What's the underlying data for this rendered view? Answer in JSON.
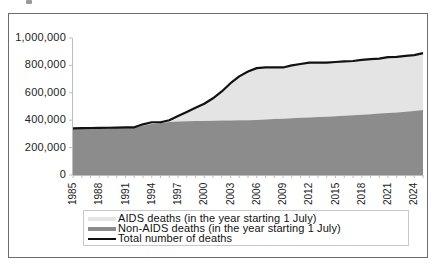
{
  "chart_data": {
    "type": "area",
    "title": "",
    "xlabel": "",
    "ylabel": "",
    "ylim": [
      0,
      1000000
    ],
    "xlim": [
      1985,
      2025
    ],
    "grid": false,
    "legend_position": "bottom",
    "y_ticks": [
      "0",
      "200,000",
      "400,000",
      "600,000",
      "800,000",
      "1,000,000"
    ],
    "y_tick_values": [
      0,
      200000,
      400000,
      600000,
      800000,
      1000000
    ],
    "x_ticks": [
      "1985",
      "1988",
      "1991",
      "1994",
      "1997",
      "2000",
      "2003",
      "2006",
      "2009",
      "2012",
      "2015",
      "2018",
      "2021",
      "2024"
    ],
    "x": [
      1985,
      1986,
      1987,
      1988,
      1989,
      1990,
      1991,
      1992,
      1993,
      1994,
      1995,
      1996,
      1997,
      1998,
      1999,
      2000,
      2001,
      2002,
      2003,
      2004,
      2005,
      2006,
      2007,
      2008,
      2009,
      2010,
      2011,
      2012,
      2013,
      2014,
      2015,
      2016,
      2017,
      2018,
      2019,
      2020,
      2021,
      2022,
      2023,
      2024,
      2025
    ],
    "series": [
      {
        "name": "Non-AIDS deaths (in the year starting 1 July)",
        "kind": "stacked-area",
        "color": "#8c8c8c",
        "values": [
          340000,
          342000,
          343000,
          344000,
          345000,
          346000,
          347000,
          348000,
          360000,
          372000,
          380000,
          386000,
          390000,
          392000,
          394000,
          395000,
          396000,
          397000,
          398000,
          399000,
          400000,
          402000,
          405000,
          408000,
          411000,
          414000,
          417000,
          420000,
          423000,
          426000,
          429000,
          432000,
          436000,
          440000,
          444000,
          448000,
          452000,
          457000,
          462000,
          468000,
          475000
        ]
      },
      {
        "name": "AIDS deaths (in the year starting 1 July)",
        "kind": "stacked-area",
        "color": "#e4e4e4",
        "values": [
          0,
          0,
          0,
          0,
          0,
          0,
          0,
          0,
          10000,
          13000,
          5000,
          14000,
          40000,
          68000,
          96000,
          125000,
          164000,
          213000,
          272000,
          321000,
          355000,
          378000,
          380000,
          377000,
          374000,
          386000,
          393000,
          400000,
          397000,
          394000,
          396000,
          398000,
          396000,
          400000,
          402000,
          402000,
          408000,
          405000,
          408000,
          407000,
          415000
        ]
      },
      {
        "name": "Total number of deaths",
        "kind": "line",
        "color": "#111111",
        "values": [
          340000,
          342000,
          343000,
          344000,
          345000,
          346000,
          347000,
          348000,
          370000,
          385000,
          385000,
          400000,
          430000,
          460000,
          490000,
          520000,
          560000,
          610000,
          670000,
          720000,
          755000,
          780000,
          785000,
          785000,
          785000,
          800000,
          810000,
          820000,
          820000,
          820000,
          825000,
          830000,
          832000,
          840000,
          846000,
          850000,
          860000,
          862000,
          870000,
          875000,
          890000
        ]
      }
    ]
  },
  "legend": {
    "items": [
      {
        "label": "AIDS deaths (in the year starting 1 July)",
        "swatch": "light-gray-band"
      },
      {
        "label": "Non-AIDS deaths (in the year starting 1 July)",
        "swatch": "dark-gray-band"
      },
      {
        "label": "Total number of deaths",
        "swatch": "black-line"
      }
    ]
  }
}
